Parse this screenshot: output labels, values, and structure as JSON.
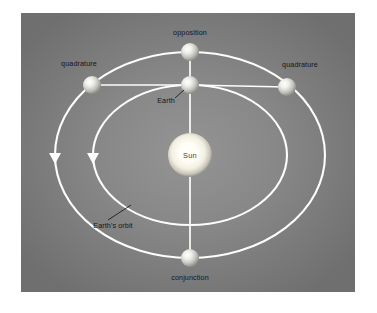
{
  "diagram": {
    "type": "astronomy-orbital-diagram",
    "panel": {
      "background_color": "#767676",
      "center_glow_color": "#8d8d8d",
      "x": 21,
      "y": 13,
      "width": 334,
      "height": 279
    },
    "page_background_color": "#ffffff",
    "orbit_color": "#fdfdfb",
    "label_color": "#14161c",
    "center": {
      "x": 190,
      "y": 155
    },
    "sun": {
      "label": "Sun",
      "cx": 190,
      "cy": 155,
      "r": 22,
      "core_color": "#fffdf2",
      "rim_color": "#9a9a96"
    },
    "orbits": [
      {
        "name": "earths-orbit",
        "label": "Earth's orbit",
        "rx": 97,
        "ry": 70,
        "arrow": {
          "x": 93,
          "y": 158,
          "direction": "down"
        }
      },
      {
        "name": "outer-planet-orbit",
        "label": "",
        "rx": 135,
        "ry": 103,
        "arrow": {
          "x": 55,
          "y": 158,
          "direction": "down"
        }
      }
    ],
    "bodies": [
      {
        "name": "earth",
        "label": "Earth",
        "cx": 190,
        "cy": 85,
        "r": 9,
        "label_x": 166,
        "label_y": 101,
        "leader": {
          "x1": 175,
          "y1": 98,
          "x2": 184,
          "y2": 90
        }
      },
      {
        "name": "opposition",
        "label": "opposition",
        "cx": 190,
        "cy": 52,
        "r": 9,
        "label_x": 190,
        "label_y": 33,
        "leader": null
      },
      {
        "name": "quadrature-left",
        "label": "quadrature",
        "cx": 92,
        "cy": 85,
        "r": 9,
        "label_x": 79,
        "label_y": 64,
        "leader": null
      },
      {
        "name": "quadrature-right",
        "label": "quadrature",
        "cx": 287,
        "cy": 87,
        "r": 9,
        "label_x": 300,
        "label_y": 65,
        "leader": null
      },
      {
        "name": "conjunction",
        "label": "conjunction",
        "cx": 190,
        "cy": 258,
        "r": 9,
        "label_x": 190,
        "label_y": 278,
        "leader": null
      }
    ],
    "orbit_annotation": {
      "name": "earths-orbit-annotation",
      "label": "Earth's orbit",
      "label_x": 113,
      "label_y": 226,
      "leader": {
        "x1": 108,
        "y1": 220,
        "x2": 131,
        "y2": 205
      }
    },
    "sight_lines": [
      {
        "name": "earth-to-opposition",
        "x1": 190,
        "y1": 85,
        "x2": 190,
        "y2": 52
      },
      {
        "name": "earth-to-quadrature-left",
        "x1": 190,
        "y1": 85,
        "x2": 92,
        "y2": 85
      },
      {
        "name": "earth-to-quadrature-right",
        "x1": 190,
        "y1": 85,
        "x2": 287,
        "y2": 87
      },
      {
        "name": "earth-to-conjunction",
        "x1": 190,
        "y1": 85,
        "x2": 190,
        "y2": 258
      }
    ]
  }
}
